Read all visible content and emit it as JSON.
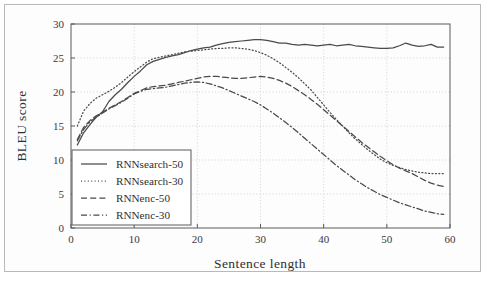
{
  "figure": {
    "background": "#ffffff",
    "frame_color": "#b9b9b9",
    "line_color": "#4a4a4a",
    "grid_color": "#c9c9c9"
  },
  "chart_data": {
    "type": "line",
    "title": "",
    "xlabel": "Sentence length",
    "ylabel": "BLEU score",
    "xlim": [
      0,
      60
    ],
    "ylim": [
      0,
      30
    ],
    "xticks": [
      0,
      10,
      20,
      30,
      40,
      50,
      60
    ],
    "yticks": [
      0,
      5,
      10,
      15,
      20,
      25,
      30
    ],
    "grid": true,
    "legend_position": "lower left",
    "x": [
      1,
      2,
      3,
      4,
      5,
      6,
      7,
      8,
      9,
      10,
      11,
      12,
      13,
      14,
      15,
      16,
      17,
      18,
      19,
      20,
      21,
      22,
      23,
      24,
      25,
      26,
      27,
      28,
      29,
      30,
      31,
      32,
      33,
      34,
      35,
      36,
      37,
      38,
      39,
      40,
      41,
      42,
      43,
      44,
      45,
      46,
      47,
      48,
      49,
      50,
      51,
      52,
      53,
      54,
      55,
      56,
      57,
      58,
      59
    ],
    "series": [
      {
        "name": "RNNsearch-50",
        "style": "solid",
        "values": [
          12.2,
          14.0,
          15.2,
          16.3,
          17.1,
          18.6,
          19.6,
          20.4,
          21.4,
          22.3,
          23.1,
          24.0,
          24.5,
          24.8,
          25.1,
          25.3,
          25.5,
          25.8,
          26.1,
          26.3,
          26.5,
          26.6,
          26.9,
          27.1,
          27.3,
          27.4,
          27.5,
          27.6,
          27.7,
          27.7,
          27.6,
          27.4,
          27.2,
          27.2,
          27.0,
          26.9,
          27.0,
          26.9,
          26.8,
          26.9,
          27.0,
          26.8,
          26.9,
          27.0,
          26.8,
          26.7,
          26.6,
          26.5,
          26.4,
          26.4,
          26.5,
          26.8,
          27.2,
          26.9,
          26.7,
          26.8,
          27.0,
          26.6,
          26.6
        ]
      },
      {
        "name": "RNNsearch-30",
        "style": "dotted",
        "values": [
          15.0,
          17.2,
          18.3,
          19.1,
          19.6,
          20.1,
          20.7,
          21.4,
          22.2,
          23.0,
          23.7,
          24.4,
          24.9,
          25.1,
          25.3,
          25.5,
          25.7,
          25.9,
          26.0,
          26.1,
          26.2,
          26.3,
          26.4,
          26.4,
          26.5,
          26.5,
          26.4,
          26.3,
          26.1,
          25.8,
          25.4,
          24.9,
          24.3,
          23.6,
          22.9,
          22.1,
          21.2,
          20.3,
          19.2,
          18.1,
          17.0,
          16.0,
          15.0,
          14.0,
          13.1,
          12.3,
          11.5,
          10.8,
          10.1,
          9.6,
          9.2,
          8.9,
          8.6,
          8.4,
          8.2,
          8.1,
          8.0,
          8.0,
          8.0
        ]
      },
      {
        "name": "RNNenc-50",
        "style": "dashed",
        "values": [
          13.0,
          14.8,
          15.8,
          16.5,
          17.0,
          17.6,
          18.1,
          18.6,
          19.2,
          19.8,
          20.2,
          20.6,
          20.8,
          20.9,
          21.0,
          21.2,
          21.4,
          21.6,
          21.8,
          22.0,
          22.2,
          22.3,
          22.3,
          22.2,
          22.1,
          22.0,
          22.0,
          22.1,
          22.2,
          22.3,
          22.2,
          22.0,
          21.7,
          21.3,
          20.8,
          20.2,
          19.6,
          18.9,
          18.2,
          17.4,
          16.6,
          15.8,
          15.0,
          14.2,
          13.4,
          12.6,
          11.9,
          11.2,
          10.5,
          9.9,
          9.3,
          8.8,
          8.4,
          8.0,
          7.5,
          7.0,
          6.6,
          6.3,
          6.1
        ]
      },
      {
        "name": "RNNenc-30",
        "style": "dashdot",
        "values": [
          12.8,
          14.5,
          15.6,
          16.3,
          16.9,
          17.5,
          18.0,
          18.5,
          19.1,
          19.7,
          20.1,
          20.4,
          20.5,
          20.6,
          20.7,
          20.9,
          21.1,
          21.3,
          21.4,
          21.5,
          21.4,
          21.2,
          20.9,
          20.6,
          20.2,
          19.8,
          19.4,
          19.0,
          18.6,
          18.1,
          17.5,
          16.9,
          16.2,
          15.5,
          14.8,
          14.0,
          13.2,
          12.4,
          11.6,
          10.8,
          10.0,
          9.2,
          8.5,
          7.8,
          7.1,
          6.5,
          5.9,
          5.4,
          4.9,
          4.5,
          4.1,
          3.7,
          3.4,
          3.1,
          2.8,
          2.5,
          2.3,
          2.1,
          2.0
        ]
      }
    ]
  }
}
